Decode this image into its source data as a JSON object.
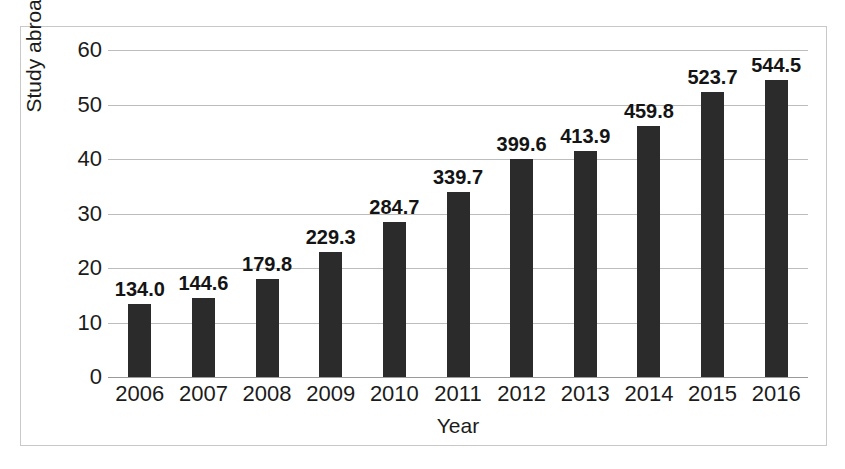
{
  "chart_data": {
    "type": "bar",
    "title": "",
    "xlabel": "Year",
    "ylabel": "Study abroad",
    "categories": [
      "2006",
      "2007",
      "2008",
      "2009",
      "2010",
      "2011",
      "2012",
      "2013",
      "2014",
      "2015",
      "2016"
    ],
    "values": [
      13.4,
      14.46,
      17.98,
      22.93,
      28.47,
      33.97,
      39.96,
      41.39,
      45.98,
      52.37,
      54.45
    ],
    "data_labels": [
      "134.0",
      "144.6",
      "179.8",
      "229.3",
      "284.7",
      "339.7",
      "399.6",
      "413.9",
      "459.8",
      "523.7",
      "544.5"
    ],
    "ylim": [
      0,
      60
    ],
    "y_ticks": [
      0,
      10,
      20,
      30,
      40,
      50,
      60
    ],
    "y_tick_labels": [
      "0",
      "10",
      "20",
      "30",
      "40",
      "50",
      "60"
    ],
    "grid": true,
    "legend": "none",
    "bar_color": "#2b2b2b",
    "gridline_color": "#bdbdbd",
    "text_color": "#1b1b1b",
    "background_color": "#ffffff",
    "border_color": "#c9c9c9"
  }
}
